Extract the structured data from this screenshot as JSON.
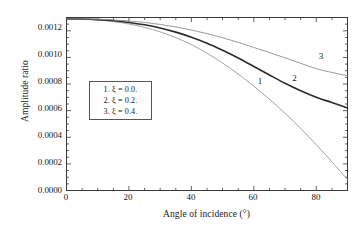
{
  "chart_data": {
    "type": "line",
    "title": "",
    "xlabel": "Angle of incidence (°)",
    "ylabel": "Amplitude ratio",
    "xlim": [
      0,
      90
    ],
    "ylim": [
      0,
      0.0013
    ],
    "grid": false,
    "legend_position": "inside-left",
    "xticks": [
      "0",
      "20",
      "40",
      "60",
      "80"
    ],
    "xtick_values": [
      0,
      20,
      40,
      60,
      80
    ],
    "yticks": [
      "0.0000",
      "0.0002",
      "0.0004",
      "0.0006",
      "0.0008",
      "0.0010",
      "0.0012"
    ],
    "ytick_values": [
      0.0,
      0.0002,
      0.0004,
      0.0006,
      0.0008,
      0.001,
      0.0012
    ],
    "x": [
      0,
      5,
      10,
      15,
      20,
      25,
      30,
      35,
      40,
      45,
      50,
      55,
      60,
      65,
      70,
      75,
      80,
      85,
      90
    ],
    "series": [
      {
        "name": "1",
        "label": "1. ξ = 0.0.",
        "xi": 0.0,
        "color": "#9a9a9a",
        "width": 0.9,
        "curve_label": "1",
        "values": [
          0.00129,
          0.001288,
          0.001281,
          0.001269,
          0.001251,
          0.001226,
          0.001192,
          0.001149,
          0.001096,
          0.001032,
          0.000958,
          0.000875,
          0.000784,
          0.000686,
          0.00058,
          0.000466,
          0.000344,
          0.000216,
          8.2e-05
        ]
      },
      {
        "name": "2",
        "label": "2. ξ = 0.2.",
        "xi": 0.2,
        "color": "#2b2b2b",
        "width": 1.6,
        "curve_label": "2",
        "values": [
          0.00129,
          0.001289,
          0.001284,
          0.001276,
          0.001263,
          0.001245,
          0.001221,
          0.00119,
          0.001152,
          0.001107,
          0.001054,
          0.000996,
          0.000932,
          0.000868,
          0.000806,
          0.00075,
          0.000701,
          0.000661,
          0.00062
        ]
      },
      {
        "name": "3",
        "label": "3. ξ = 0.4.",
        "xi": 0.4,
        "color": "#8f8f8f",
        "width": 0.9,
        "curve_label": "3",
        "values": [
          0.00129,
          0.00129,
          0.001287,
          0.001282,
          0.001274,
          0.001263,
          0.001248,
          0.001229,
          0.001206,
          0.001179,
          0.001148,
          0.001113,
          0.001075,
          0.001036,
          0.000997,
          0.000956,
          0.000915,
          0.000887,
          0.000862
        ]
      }
    ],
    "legend_entries": [
      "1. ξ = 0.0.",
      "2. ξ = 0.2.",
      "3. ξ = 0.4."
    ],
    "curve_annotations": [
      {
        "text": "1",
        "x": 62.0,
        "y": 0.00082
      },
      {
        "text": "2",
        "x": 73.0,
        "y": 0.000845
      },
      {
        "text": "3",
        "x": 81.5,
        "y": 0.00101
      }
    ],
    "colors": {
      "axis": "#3a3a3a",
      "text": "#1a1a1a",
      "legend_border": "#555555",
      "background": "#ffffff"
    }
  }
}
